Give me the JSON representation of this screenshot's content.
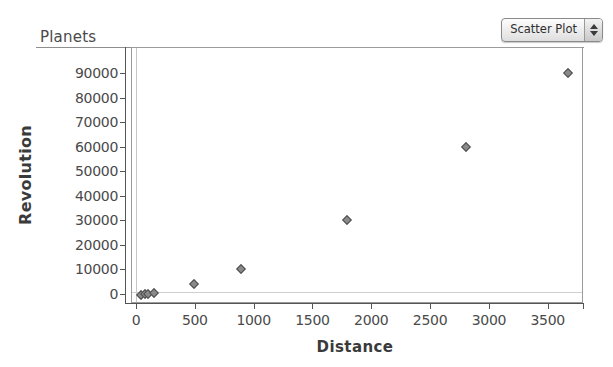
{
  "window": {
    "title": "Planets"
  },
  "controls": {
    "plot_type": {
      "name": "plot-type-select",
      "value": "Scatter Plot",
      "stepper_up_icon": "triangle-up-icon",
      "stepper_down_icon": "triangle-down-icon"
    }
  },
  "chart_data": {
    "type": "scatter",
    "title": "Planets",
    "xlabel": "Distance",
    "ylabel": "Revolution",
    "xlim": [
      0,
      3800
    ],
    "ylim": [
      0,
      95000
    ],
    "x_ticks": [
      0,
      500,
      1000,
      1500,
      2000,
      2500,
      3000,
      3500
    ],
    "y_ticks": [
      0,
      10000,
      20000,
      30000,
      40000,
      50000,
      60000,
      70000,
      80000,
      90000
    ],
    "x_tick_labels": [
      "0",
      "500",
      "1000",
      "1500",
      "2000",
      "2500",
      "3000",
      "3500"
    ],
    "y_tick_labels": [
      "0",
      "10000",
      "20000",
      "30000",
      "40000",
      "50000",
      "60000",
      "70000",
      "80000",
      "90000"
    ],
    "grid": false,
    "legend": false,
    "marker": "diamond",
    "marker_color": "#8a8a8a",
    "marker_edge_color": "#4d4d4d",
    "points": [
      {
        "x": 36,
        "y": 88
      },
      {
        "x": 67,
        "y": 225
      },
      {
        "x": 93,
        "y": 365
      },
      {
        "x": 142,
        "y": 687
      },
      {
        "x": 484,
        "y": 4330
      },
      {
        "x": 887,
        "y": 10750
      },
      {
        "x": 1784,
        "y": 30700
      },
      {
        "x": 2796,
        "y": 60200
      },
      {
        "x": 3666,
        "y": 90500
      }
    ]
  }
}
